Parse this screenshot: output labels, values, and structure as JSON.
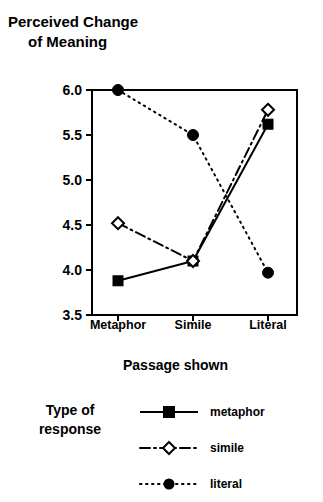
{
  "title": {
    "line1": "Perceived Change",
    "line2": "of Meaning"
  },
  "axis": {
    "x_title": "Passage shown",
    "y_ticks": [
      "6.0",
      "5.5",
      "5.0",
      "4.5",
      "4.0",
      "3.5"
    ],
    "x_ticks": [
      "Metaphor",
      "Simile",
      "Literal"
    ]
  },
  "legend": {
    "title_line1": "Type of",
    "title_line2": "response",
    "entries": [
      {
        "label": "metaphor",
        "marker": "filled-square-icon",
        "line": "solid"
      },
      {
        "label": "simile",
        "marker": "open-diamond-icon",
        "line": "dash-dot"
      },
      {
        "label": "literal",
        "marker": "filled-circle-icon",
        "line": "dotted"
      }
    ]
  },
  "colors": {
    "ink": "#000000",
    "background": "#ffffff"
  },
  "chart_data": {
    "type": "line",
    "title": "Perceived Change of Meaning",
    "xlabel": "Passage shown",
    "ylabel": "Perceived Change of Meaning",
    "categories": [
      "Metaphor",
      "Simile",
      "Literal"
    ],
    "ylim": [
      3.5,
      6.0
    ],
    "yticks": [
      3.5,
      4.0,
      4.5,
      5.0,
      5.5,
      6.0
    ],
    "grid": false,
    "legend_position": "below-plot",
    "legend_title": "Type of response",
    "series": [
      {
        "name": "metaphor",
        "values": [
          3.88,
          4.1,
          5.62
        ],
        "marker": "filled-square",
        "line": "solid"
      },
      {
        "name": "simile",
        "values": [
          4.52,
          4.1,
          5.78
        ],
        "marker": "open-diamond",
        "line": "dash-dot"
      },
      {
        "name": "literal",
        "values": [
          6.0,
          5.5,
          3.97
        ],
        "marker": "filled-circle",
        "line": "dotted"
      }
    ]
  }
}
